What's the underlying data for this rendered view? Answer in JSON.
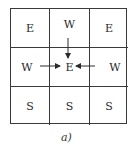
{
  "diagram": {
    "grid": {
      "rows": 3,
      "cols": 3,
      "cells": [
        [
          "E",
          "W",
          "E"
        ],
        [
          "W",
          "E",
          "W"
        ],
        [
          "S",
          "S",
          "S"
        ]
      ]
    },
    "arrows": [
      {
        "from": "top-center (W)",
        "to": "center (E)",
        "direction": "down"
      },
      {
        "from": "middle-left (W)",
        "to": "center (E)",
        "direction": "right"
      },
      {
        "from": "middle-right (W)",
        "to": "center (E)",
        "direction": "left"
      }
    ],
    "caption": "a)",
    "colors": {
      "line": "#3a3a3a",
      "text": "#2a2a2a",
      "background": "#ffffff"
    }
  }
}
